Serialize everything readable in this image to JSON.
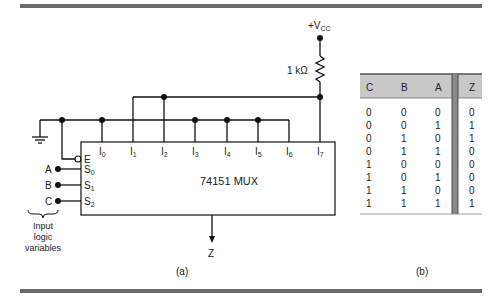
{
  "figure": {
    "part_a_label": "(a)",
    "part_b_label": "(b)"
  },
  "circuit": {
    "supply_label": "+V",
    "supply_sub": "CC",
    "resistor_label": "1 kΩ",
    "chip_label": "74151 MUX",
    "enable_label": "E",
    "data_inputs": [
      {
        "base": "I",
        "sub": "0"
      },
      {
        "base": "I",
        "sub": "1"
      },
      {
        "base": "I",
        "sub": "2"
      },
      {
        "base": "I",
        "sub": "3"
      },
      {
        "base": "I",
        "sub": "4"
      },
      {
        "base": "I",
        "sub": "5"
      },
      {
        "base": "I",
        "sub": "6"
      },
      {
        "base": "I",
        "sub": "7"
      }
    ],
    "select_inputs": [
      {
        "var": "A",
        "base": "S",
        "sub": "0"
      },
      {
        "var": "B",
        "base": "S",
        "sub": "1"
      },
      {
        "var": "C",
        "base": "S",
        "sub": "2"
      }
    ],
    "output_label": "Z",
    "input_caption": [
      "Input",
      "logic",
      "variables"
    ]
  },
  "truth_table": {
    "headers": [
      "C",
      "B",
      "A",
      "Z"
    ],
    "rows": [
      [
        "0",
        "0",
        "0",
        "0"
      ],
      [
        "0",
        "0",
        "1",
        "1"
      ],
      [
        "0",
        "1",
        "0",
        "1"
      ],
      [
        "0",
        "1",
        "1",
        "0"
      ],
      [
        "1",
        "0",
        "0",
        "0"
      ],
      [
        "1",
        "0",
        "1",
        "0"
      ],
      [
        "1",
        "1",
        "0",
        "0"
      ],
      [
        "1",
        "1",
        "1",
        "1"
      ]
    ]
  },
  "colors": {
    "rule": "#6b6b6b",
    "table_header": "#c8c8c8",
    "separator": "#8a8a8a"
  }
}
